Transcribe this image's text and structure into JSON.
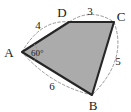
{
  "figure": {
    "type": "geometry-diagram",
    "shape_name": "quadrilateral-ABCD",
    "background_color": "#ffffff",
    "fill_color": "#ababab",
    "outline_color": "#262626",
    "dash_color": "#8c8c8c",
    "vertices": [
      {
        "name": "A",
        "label": "A",
        "x": 22,
        "y": 52,
        "label_x": 9,
        "label_y": 57
      },
      {
        "name": "D",
        "label": "D",
        "x": 69,
        "y": 22,
        "label_x": 62,
        "label_y": 17
      },
      {
        "name": "C",
        "label": "C",
        "x": 114,
        "y": 22,
        "label_x": 118,
        "label_y": 20
      },
      {
        "name": "B",
        "label": "B",
        "x": 92,
        "y": 95,
        "label_x": 92,
        "label_y": 109
      }
    ],
    "sides": [
      {
        "name": "AD",
        "label": "4",
        "label_x": 38,
        "label_y": 28
      },
      {
        "name": "DC",
        "label": "3",
        "label_x": 90,
        "label_y": 14
      },
      {
        "name": "CB",
        "label": "5",
        "label_x": 117,
        "label_y": 62
      },
      {
        "name": "BA",
        "label": "6",
        "label_x": 52,
        "label_y": 88
      }
    ],
    "angles": [
      {
        "at": "A",
        "label": "60°",
        "label_x": 31,
        "label_y": 56
      }
    ],
    "polygon_points": "22,52 69,22 114,22 92,95",
    "arc_paths": {
      "AD": "M 22,52 Q 41,19 69,22",
      "DC": "M 69,22 Q 91,7 114,22",
      "CB": "M 114,22 Q 128,60 92,95",
      "BA": "M 92,95 Q 50,85 22,52"
    },
    "angle_arc_path": "M 34,44 Q 41,52 34,61"
  }
}
